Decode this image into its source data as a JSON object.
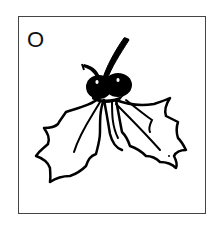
{
  "card": {
    "letter": "O",
    "illustration": "holly-icon",
    "border_color": "#444444",
    "ink_color": "#000000",
    "background": "#ffffff"
  }
}
